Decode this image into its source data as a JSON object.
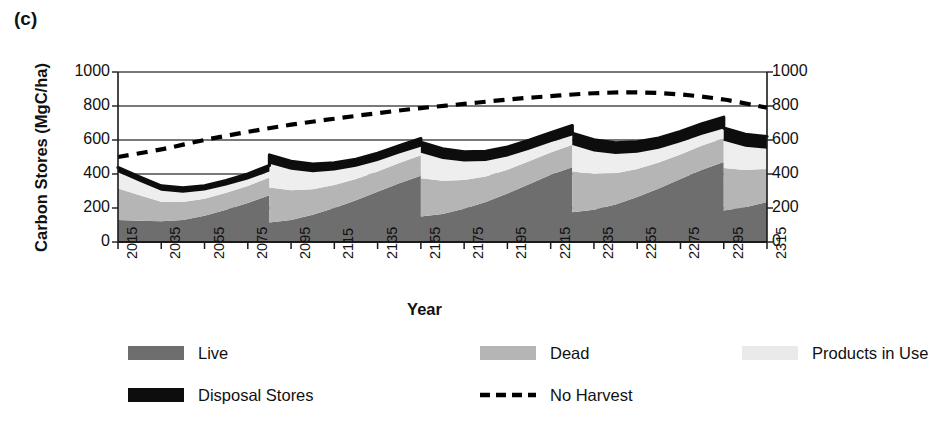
{
  "panel": {
    "label": "(c)"
  },
  "axes": {
    "ylabel": "Carbon Stores (MgC/ha)",
    "xlabel": "Year",
    "y_ticks": [
      "0",
      "200",
      "400",
      "600",
      "800",
      "1000"
    ],
    "y_ticks_right": [
      "0",
      "200",
      "400",
      "600",
      "800",
      "1000"
    ],
    "x_ticks": [
      "2015",
      "2035",
      "2055",
      "2075",
      "2095",
      "2115",
      "2135",
      "2155",
      "2175",
      "2195",
      "2215",
      "2235",
      "2255",
      "2275",
      "2295",
      "2315"
    ]
  },
  "legend": {
    "items": [
      {
        "label": "Live",
        "swatch": "filled",
        "color": "#6e6e6e",
        "row": 0,
        "col": 0
      },
      {
        "label": "Dead",
        "swatch": "filled",
        "color": "#b5b5b5",
        "row": 0,
        "col": 1
      },
      {
        "label": "Products in Use",
        "swatch": "filled",
        "color": "#eaeaea",
        "row": 0,
        "col": 2
      },
      {
        "label": "Disposal Stores",
        "swatch": "filled",
        "color": "#0d0d0d",
        "row": 1,
        "col": 0
      },
      {
        "label": "No Harvest",
        "swatch": "dashed",
        "color": "#000000",
        "row": 1,
        "col": 1
      }
    ]
  },
  "colors": {
    "live": "#6e6e6e",
    "dead": "#b5b5b5",
    "products": "#eeeeee",
    "disposal": "#0d0d0d",
    "no_harvest": "#000000",
    "gridline": "#4d4d4d",
    "axis": "#1a1a1a"
  },
  "chart_data": {
    "type": "area",
    "title": "",
    "subtitle": "",
    "xlabel": "Year",
    "ylabel": "Carbon Stores (MgC/ha)",
    "xlim": [
      2015,
      2315
    ],
    "ylim": [
      0,
      1000
    ],
    "y_ticks": [
      0,
      200,
      400,
      600,
      800,
      1000
    ],
    "x_ticks": [
      2015,
      2035,
      2055,
      2075,
      2095,
      2115,
      2135,
      2155,
      2175,
      2195,
      2215,
      2235,
      2255,
      2275,
      2295,
      2315
    ],
    "grid": "horizontal",
    "legend_position": "below",
    "stacked": true,
    "harvest_years": [
      2085,
      2155,
      2225,
      2295
    ],
    "harvest_interval_years": 70,
    "x": [
      2015,
      2025,
      2035,
      2045,
      2055,
      2065,
      2075,
      2085,
      2085,
      2095,
      2105,
      2115,
      2125,
      2135,
      2145,
      2155,
      2155,
      2165,
      2175,
      2185,
      2195,
      2205,
      2215,
      2225,
      2225,
      2235,
      2245,
      2255,
      2265,
      2275,
      2285,
      2295,
      2295,
      2305,
      2315
    ],
    "series": [
      {
        "name": "Live",
        "color": "#6e6e6e",
        "values": [
          130,
          125,
          122,
          130,
          155,
          190,
          230,
          275,
          115,
          130,
          160,
          200,
          245,
          295,
          345,
          390,
          150,
          165,
          195,
          235,
          285,
          340,
          395,
          440,
          175,
          190,
          220,
          265,
          315,
          370,
          425,
          470,
          185,
          205,
          235
        ]
      },
      {
        "name": "Dead",
        "color": "#b5b5b5",
        "values": [
          185,
          150,
          115,
          105,
          100,
          100,
          100,
          105,
          205,
          175,
          150,
          135,
          125,
          120,
          120,
          120,
          225,
          195,
          170,
          150,
          140,
          135,
          132,
          132,
          240,
          210,
          185,
          165,
          152,
          145,
          142,
          140,
          250,
          218,
          195
        ]
      },
      {
        "name": "Products in Use",
        "color": "#eeeeee",
        "values": [
          95,
          80,
          65,
          55,
          48,
          42,
          38,
          35,
          140,
          120,
          100,
          85,
          72,
          62,
          55,
          50,
          150,
          128,
          108,
          92,
          78,
          68,
          60,
          55,
          155,
          133,
          112,
          95,
          82,
          72,
          64,
          58,
          160,
          138,
          118
        ]
      },
      {
        "name": "Disposal Stores",
        "color": "#0d0d0d",
        "values": [
          28,
          28,
          28,
          28,
          28,
          30,
          32,
          35,
          52,
          50,
          48,
          46,
          45,
          45,
          46,
          48,
          62,
          60,
          58,
          56,
          55,
          55,
          56,
          58,
          70,
          68,
          66,
          64,
          63,
          63,
          64,
          66,
          75,
          73,
          72
        ]
      }
    ],
    "stack_totals": [
      438,
      383,
      330,
      318,
      331,
      362,
      400,
      450,
      512,
      475,
      458,
      466,
      487,
      522,
      566,
      608,
      587,
      548,
      531,
      533,
      558,
      598,
      643,
      685,
      640,
      601,
      583,
      589,
      612,
      650,
      695,
      734,
      670,
      634,
      620
    ],
    "no_harvest_line": {
      "name": "No Harvest",
      "style": "dashed",
      "color": "#000000",
      "x": [
        2015,
        2035,
        2055,
        2075,
        2095,
        2115,
        2135,
        2155,
        2175,
        2195,
        2215,
        2235,
        2255,
        2275,
        2295,
        2315
      ],
      "values": [
        500,
        545,
        600,
        648,
        690,
        725,
        758,
        788,
        812,
        838,
        858,
        875,
        880,
        868,
        838,
        790
      ]
    }
  }
}
